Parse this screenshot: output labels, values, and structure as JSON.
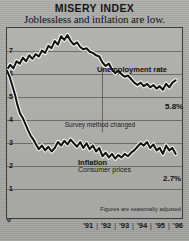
{
  "header": {
    "title": "MISERY INDEX",
    "subtitle": "Joblessless and inflation are low."
  },
  "footnote": "Figures are seasonally adjusted",
  "annotations": {
    "unemployment_label": "Unemployment rate",
    "survey_note": "Survey method changed",
    "inflation_title": "Inflation",
    "inflation_subtitle": "Consumer prices",
    "unemployment_value": "5.8%",
    "inflation_value": "2.7%"
  },
  "axis": {
    "y_top_label": "8%",
    "y_zero_label": "0",
    "y_ticks": [
      "7",
      "6",
      "5",
      "4",
      "3",
      "2",
      "1"
    ],
    "x_labels": [
      "'91",
      "'92",
      "'93",
      "'94",
      "'95",
      "'96"
    ],
    "x_tick_mark": "|"
  },
  "colors": {
    "line": "#111111",
    "halo": "#f2f2f0",
    "background": "#a8a8a6",
    "frame": "#3b3b3b",
    "grid": "#6d6d6b"
  },
  "chart_data": {
    "type": "line",
    "title": "MISERY INDEX",
    "subtitle": "Joblessless and inflation are low.",
    "xlabel": "",
    "ylabel": "percent",
    "ylim": [
      0,
      8
    ],
    "xlim": [
      1991.0,
      1996.5
    ],
    "grid": true,
    "legend": "inline-annotations",
    "note": "Figures are seasonally adjusted",
    "ytick_labels": [
      "8%",
      "7",
      "6",
      "5",
      "4",
      "3",
      "2",
      "1",
      "0"
    ],
    "ytick_values": [
      8,
      7,
      6,
      5,
      4,
      3,
      2,
      1,
      0
    ],
    "xtick_labels": [
      "'91",
      "'92",
      "'93",
      "'94",
      "'95",
      "'96"
    ],
    "xtick_values": [
      1991.5,
      1992.5,
      1993.5,
      1994.5,
      1995.5,
      1996.25
    ],
    "annotations": [
      {
        "text": "Unemployment rate",
        "x": 1993.6,
        "y": 7.6
      },
      {
        "text": "Survey method changed",
        "x": 1993.3,
        "y": 4.6
      },
      {
        "text": "Inflation",
        "x": 1993.0,
        "y": 3.35
      },
      {
        "text": "Consumer prices",
        "x": 1993.0,
        "y": 3.05
      },
      {
        "text": "5.8%",
        "x": 1996.4,
        "y": 5.8
      },
      {
        "text": "2.7%",
        "x": 1996.4,
        "y": 2.7
      }
    ],
    "series": [
      {
        "name": "Unemployment rate",
        "end_value": 5.8,
        "x": [
          1991.0,
          1991.1,
          1991.2,
          1991.3,
          1991.4,
          1991.5,
          1991.6,
          1991.7,
          1991.8,
          1991.9,
          1992.0,
          1992.1,
          1992.2,
          1992.3,
          1992.4,
          1992.5,
          1992.6,
          1992.7,
          1992.8,
          1992.9,
          1993.0,
          1993.1,
          1993.2,
          1993.3,
          1993.4,
          1993.5,
          1993.6,
          1993.7,
          1993.8,
          1993.9,
          1994.0,
          1994.1,
          1994.2,
          1994.3,
          1994.4,
          1994.5,
          1994.6,
          1994.7,
          1994.8,
          1994.9,
          1995.0,
          1995.1,
          1995.2,
          1995.3,
          1995.4,
          1995.5,
          1995.6,
          1995.7,
          1995.8,
          1995.9,
          1996.0,
          1996.1,
          1996.2,
          1996.3
        ],
        "y": [
          6.25,
          6.45,
          6.3,
          6.6,
          6.5,
          6.75,
          6.6,
          6.85,
          6.7,
          6.9,
          6.8,
          7.05,
          6.95,
          7.25,
          7.15,
          7.45,
          7.3,
          7.65,
          7.5,
          7.7,
          7.45,
          7.3,
          7.4,
          7.2,
          7.1,
          7.15,
          7.0,
          6.95,
          6.85,
          6.8,
          6.55,
          6.4,
          6.5,
          6.25,
          6.1,
          6.2,
          6.05,
          5.95,
          6.0,
          5.85,
          5.7,
          5.6,
          5.7,
          5.55,
          5.65,
          5.5,
          5.6,
          5.45,
          5.55,
          5.4,
          5.65,
          5.5,
          5.7,
          5.8
        ]
      },
      {
        "name": "Inflation (Consumer prices)",
        "end_value": 2.7,
        "x": [
          1991.0,
          1991.08,
          1991.16,
          1991.25,
          1991.33,
          1991.41,
          1991.5,
          1991.58,
          1991.66,
          1991.75,
          1991.83,
          1991.91,
          1992.0,
          1992.1,
          1992.2,
          1992.3,
          1992.4,
          1992.5,
          1992.6,
          1992.7,
          1992.8,
          1992.9,
          1993.0,
          1993.1,
          1993.2,
          1993.3,
          1993.4,
          1993.5,
          1993.6,
          1993.7,
          1993.8,
          1993.9,
          1994.0,
          1994.1,
          1994.2,
          1994.3,
          1994.4,
          1994.5,
          1994.6,
          1994.7,
          1994.8,
          1994.9,
          1995.0,
          1995.1,
          1995.2,
          1995.3,
          1995.4,
          1995.5,
          1995.6,
          1995.7,
          1995.8,
          1995.9,
          1996.0,
          1996.1,
          1996.2,
          1996.3
        ],
        "y": [
          6.2,
          5.95,
          5.6,
          5.2,
          4.75,
          4.4,
          4.2,
          3.95,
          3.7,
          3.45,
          3.3,
          3.1,
          2.9,
          3.05,
          2.85,
          3.0,
          2.8,
          2.95,
          3.2,
          3.05,
          3.25,
          3.1,
          3.3,
          3.15,
          3.0,
          3.2,
          2.95,
          3.15,
          2.9,
          3.05,
          2.8,
          2.95,
          2.6,
          2.75,
          2.55,
          2.7,
          2.5,
          2.65,
          2.55,
          2.7,
          2.6,
          2.75,
          2.85,
          3.0,
          3.15,
          3.05,
          3.2,
          2.95,
          3.1,
          2.85,
          2.95,
          2.7,
          3.05,
          2.85,
          2.95,
          2.7
        ]
      }
    ]
  }
}
